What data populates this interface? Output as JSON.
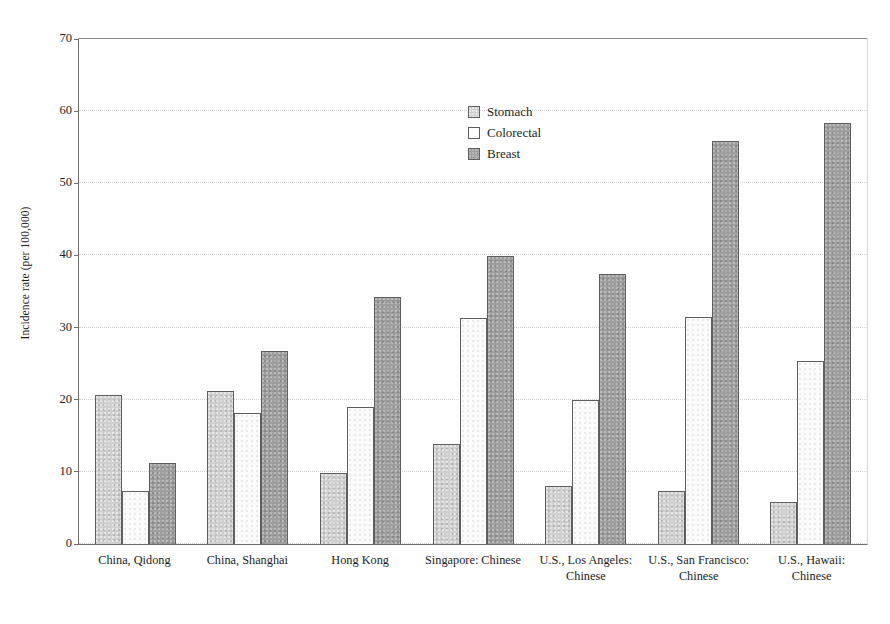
{
  "chart_data": {
    "type": "bar",
    "title": "",
    "subtitle": "",
    "xlabel": "",
    "ylabel": "Incidence rate (per 100,000)",
    "ylim": [
      0,
      70
    ],
    "ytick_step": 10,
    "yticks": [
      "0",
      "10",
      "20",
      "30",
      "40",
      "50",
      "60",
      "70"
    ],
    "grid": true,
    "legend_position": "upper-center",
    "categories": [
      "China, Qidong",
      "China, Shanghai",
      "Hong Kong",
      "Singapore: Chinese",
      "U.S., Los Angeles: Chinese",
      "U.S., San Francisco: Chinese",
      "U.S., Hawaii: Chinese"
    ],
    "series": [
      {
        "name": "Stomach",
        "color": "#cfcfcf",
        "values": [
          20.7,
          21.2,
          9.9,
          13.9,
          8.0,
          7.4,
          5.8
        ]
      },
      {
        "name": "Colorectal",
        "color": "#fbfbfb",
        "values": [
          7.4,
          18.1,
          19.0,
          31.3,
          19.9,
          31.5,
          25.3
        ]
      },
      {
        "name": "Breast",
        "color": "#9e9e9e",
        "values": [
          11.2,
          26.8,
          34.2,
          39.9,
          37.4,
          55.8,
          58.4
        ]
      }
    ]
  },
  "legend": {
    "items": [
      {
        "label": "Stomach"
      },
      {
        "label": "Colorectal"
      },
      {
        "label": "Breast"
      }
    ]
  },
  "axes": {
    "y_title": "Incidence rate (per 100,000)"
  }
}
